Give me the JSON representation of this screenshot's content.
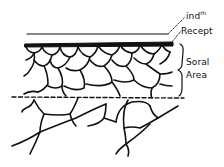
{
  "diagram": {
    "type": "botanical cross-section sketch",
    "labels": {
      "indusium": "ind",
      "indusium_sup": "m",
      "receptacle": "Recept",
      "soral_line1": "Soral",
      "soral_line2": "Area"
    },
    "colors": {
      "ink": "#111111",
      "background": "#ffffff"
    }
  }
}
